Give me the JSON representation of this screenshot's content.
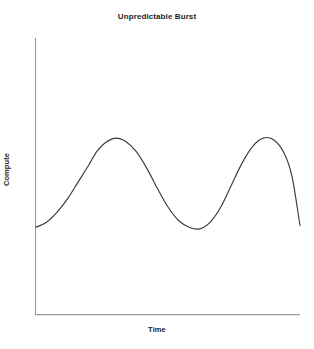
{
  "chart_data": {
    "type": "line",
    "title": "Unpredictable Burst",
    "xlabel": "Time",
    "ylabel": "Compute",
    "grid": false,
    "legend": false,
    "xticks": [],
    "yticks": [],
    "xlim": [
      0,
      100
    ],
    "ylim": [
      0,
      100
    ],
    "series": [
      {
        "name": "Compute",
        "color": "#3a3a3a",
        "x": [
          0,
          4,
          8,
          12,
          16,
          20,
          23,
          26,
          30,
          34,
          38,
          42,
          46,
          50,
          54,
          58,
          62,
          66,
          70,
          74,
          78,
          82,
          86,
          90,
          94,
          97,
          100
        ],
        "y": [
          35,
          38,
          44,
          52,
          62,
          72,
          80,
          85,
          88,
          86,
          80,
          70,
          58,
          47,
          39,
          35,
          34,
          38,
          47,
          60,
          73,
          83,
          88,
          87,
          79,
          65,
          36
        ]
      }
    ],
    "annotations": []
  },
  "axes": {
    "spine_color": "#9a9a9a",
    "x_spine": {
      "x1": 35,
      "y1": 315,
      "x2": 300,
      "y2": 315
    },
    "y_spine": {
      "x1": 35,
      "y1": 38,
      "x2": 35,
      "y2": 315
    }
  },
  "colors": {
    "background": "#ffffff",
    "line": "#3a3a3a",
    "text": "#1d1d1d",
    "spine": "#9a9a9a"
  }
}
